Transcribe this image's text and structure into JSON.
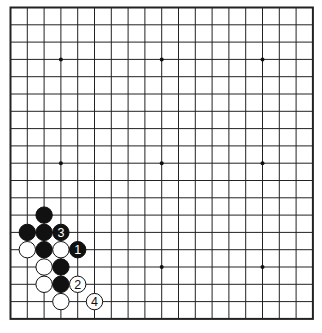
{
  "diagram": {
    "type": "go-board-diagram",
    "board_size": 19,
    "grid": {
      "left": 10.5,
      "top": 7.5,
      "dx": 16.8,
      "dy": 17.3,
      "line_color": "#222222",
      "border_width": 2,
      "line_width": 1
    },
    "background": "#ffffff",
    "star_points": [
      [
        3,
        3
      ],
      [
        9,
        3
      ],
      [
        15,
        3
      ],
      [
        3,
        9
      ],
      [
        9,
        9
      ],
      [
        15,
        9
      ],
      [
        3,
        15
      ],
      [
        9,
        15
      ],
      [
        15,
        15
      ]
    ],
    "stones": [
      {
        "color": "black",
        "col": 2,
        "row": 12,
        "label": ""
      },
      {
        "color": "black",
        "col": 1,
        "row": 13,
        "label": ""
      },
      {
        "color": "black",
        "col": 2,
        "row": 13,
        "label": ""
      },
      {
        "color": "black",
        "col": 3,
        "row": 13,
        "label": "3"
      },
      {
        "color": "white",
        "col": 1,
        "row": 14,
        "label": ""
      },
      {
        "color": "black",
        "col": 2,
        "row": 14,
        "label": ""
      },
      {
        "color": "white",
        "col": 3,
        "row": 14,
        "label": ""
      },
      {
        "color": "black",
        "col": 4,
        "row": 14,
        "label": "1"
      },
      {
        "color": "white",
        "col": 2,
        "row": 15,
        "label": ""
      },
      {
        "color": "black",
        "col": 3,
        "row": 15,
        "label": ""
      },
      {
        "color": "white",
        "col": 2,
        "row": 16,
        "label": ""
      },
      {
        "color": "black",
        "col": 3,
        "row": 16,
        "label": ""
      },
      {
        "color": "white",
        "col": 4,
        "row": 16,
        "label": "2"
      },
      {
        "color": "white",
        "col": 3,
        "row": 17,
        "label": ""
      },
      {
        "color": "white",
        "col": 5,
        "row": 17,
        "label": "4"
      }
    ]
  }
}
